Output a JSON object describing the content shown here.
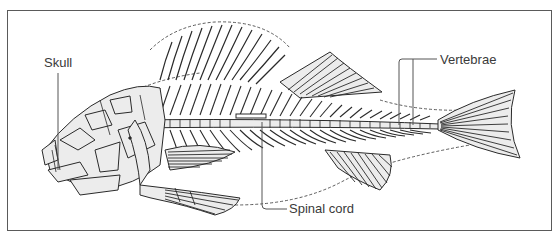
{
  "figure": {
    "labels": [
      {
        "id": "skull",
        "text": "Skull"
      },
      {
        "id": "vertebrae",
        "text": "Vertebrae"
      },
      {
        "id": "spinal_cord",
        "text": "Spinal cord"
      }
    ]
  },
  "colors": {
    "frame": "#5a5a5a",
    "bone_fill": "#ececec",
    "bone_stroke": "#2a2a2a",
    "label_text": "#3a3a3a",
    "leader_line": "#555555"
  }
}
